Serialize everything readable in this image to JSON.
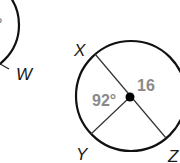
{
  "figure": {
    "left_circle": {
      "point_label": "W",
      "partial_text": "°"
    },
    "right_circle": {
      "points": [
        "X",
        "Y",
        "Z"
      ],
      "angle_label": "92°",
      "radius_label": "16"
    },
    "colors": {
      "stroke": "#111111",
      "measure_text": "#8a8a8a"
    }
  }
}
